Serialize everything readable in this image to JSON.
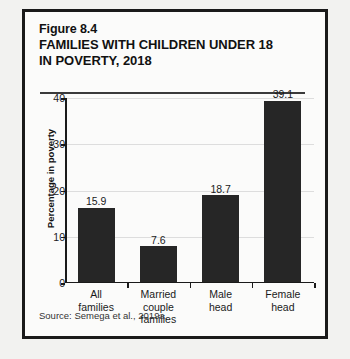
{
  "figure": {
    "number": "Figure 8.4",
    "title_line_1": "FAMILIES WITH CHILDREN UNDER 18",
    "title_line_2": "IN POVERTY, 2018",
    "source": "Source:  Semega et al., 2019a."
  },
  "chart_data": {
    "type": "bar",
    "title": "FAMILIES WITH CHILDREN UNDER 18 IN POVERTY, 2018",
    "categories": [
      "All families",
      "Married couple families",
      "Male head",
      "Female head"
    ],
    "category_lines": [
      [
        "All",
        "families"
      ],
      [
        "Married",
        "couple",
        "families"
      ],
      [
        "Male",
        "head"
      ],
      [
        "Female",
        "head"
      ]
    ],
    "values": [
      15.9,
      7.6,
      18.7,
      39.1
    ],
    "value_labels": [
      "15.9",
      "7.6",
      "18.7",
      "39.1"
    ],
    "xlabel": "",
    "ylabel": "Percentage in poverty",
    "ylim": [
      0,
      40
    ],
    "yticks": [
      0,
      10,
      20,
      30,
      40
    ],
    "ytick_labels": [
      "0",
      "10",
      "20",
      "30",
      "40"
    ],
    "grid": true,
    "legend": "none",
    "bar_color": "#262626",
    "axis_color": "#1a1a1a",
    "gridline_color": "#dddddd"
  }
}
